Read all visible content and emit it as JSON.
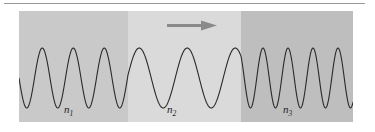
{
  "figure": {
    "background_color": "#ffffff",
    "rule_color": "#9a9a9a"
  },
  "arrow": {
    "name": "propagation-direction-arrow",
    "label": "direction of wave propagation",
    "color": "#8a8a8a",
    "direction": "right"
  },
  "media": [
    {
      "label": "n",
      "subscript": "1",
      "fill_color": "#c9c9c9",
      "wavelength_px": 31
    },
    {
      "label": "n",
      "subscript": "2",
      "fill_color": "#dadada",
      "wavelength_px": 48
    },
    {
      "label": "n",
      "subscript": "3",
      "fill_color": "#bebebe",
      "wavelength_px": 25
    }
  ],
  "chart_data": {
    "type": "line",
    "xlabel": "",
    "ylabel": "",
    "grid": false,
    "legend_position": "none",
    "xlim": [
      0,
      334
    ],
    "ylim": [
      0,
      111
    ],
    "annotations": [
      "n1",
      "n2",
      "n3"
    ],
    "series": [
      {
        "name": "wave",
        "description": "continuous sinusoid, constant amplitude, wavelength changes at each medium boundary",
        "amplitude_px": 30,
        "centerline_y_px": 67,
        "segments": [
          {
            "medium": "n1",
            "x_start": 0,
            "x_end": 109,
            "wavelength_px": 31
          },
          {
            "medium": "n2",
            "x_start": 109,
            "x_end": 222,
            "wavelength_px": 48
          },
          {
            "medium": "n3",
            "x_start": 222,
            "x_end": 334,
            "wavelength_px": 25
          }
        ]
      }
    ],
    "boundaries_x_px": [
      109,
      222
    ]
  }
}
